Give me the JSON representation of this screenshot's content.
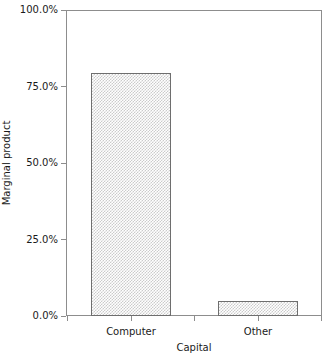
{
  "chart_data": {
    "type": "bar",
    "title": "",
    "subtitle": "",
    "xlabel": "Capital",
    "ylabel": "Marginal product",
    "categories": [
      "Computer",
      "Other"
    ],
    "values": [
      80.0,
      5.0
    ],
    "value_unit": "%",
    "ylim": [
      0,
      100
    ],
    "yticks": [
      0.0,
      25.0,
      50.0,
      75.0,
      100.0
    ],
    "ytick_labels": [
      "0.0%",
      "25.0%",
      "50.0%",
      "75.0%",
      "100.0%"
    ],
    "xtick_labels": [
      "Computer",
      "Other"
    ],
    "grid": false,
    "legend": false,
    "legend_position": "none",
    "series": [
      {
        "name": "Marginal product",
        "values": [
          80.0,
          5.0
        ]
      }
    ],
    "style": {
      "bar_fill": "#cbcbcb",
      "bar_fill_style": "checkerboard-dither",
      "bar_edge": "#6e6e6e",
      "axis_color": "#8d8d8d",
      "text_color": "#1a1a1a",
      "background": "#ffffff"
    }
  }
}
